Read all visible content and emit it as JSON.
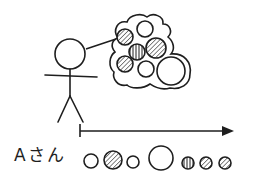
{
  "diagram": {
    "type": "concept-illustration",
    "person": {
      "icon": "stick-figure-icon",
      "thought_bubble": "cloud-icon"
    },
    "thought_circles": [
      {
        "cx": 145,
        "cy": 29,
        "r": 8,
        "fill": "plain"
      },
      {
        "cx": 125,
        "cy": 37,
        "r": 8,
        "fill": "hatch-diagonal"
      },
      {
        "cx": 137,
        "cy": 52,
        "r": 8,
        "fill": "hatch-vertical"
      },
      {
        "cx": 156,
        "cy": 48,
        "r": 10,
        "fill": "hatch-diagonal"
      },
      {
        "cx": 125,
        "cy": 64,
        "r": 8,
        "fill": "hatch-diagonal"
      },
      {
        "cx": 146,
        "cy": 69,
        "r": 8,
        "fill": "plain"
      },
      {
        "cx": 171,
        "cy": 71,
        "r": 14,
        "fill": "plain"
      }
    ],
    "timeline": {
      "arrow": "right-arrow-icon"
    },
    "sequence_label": "Aさん",
    "sequence_circles": [
      {
        "cx": 91,
        "cy": 161,
        "r": 7,
        "fill": "plain"
      },
      {
        "cx": 113,
        "cy": 160,
        "r": 9,
        "fill": "hatch-diagonal"
      },
      {
        "cx": 133,
        "cy": 162,
        "r": 6,
        "fill": "plain"
      },
      {
        "cx": 161,
        "cy": 158,
        "r": 12,
        "fill": "plain"
      },
      {
        "cx": 188,
        "cy": 163,
        "r": 6,
        "fill": "hatch-vertical"
      },
      {
        "cx": 206,
        "cy": 163,
        "r": 6,
        "fill": "hatch-diagonal"
      },
      {
        "cx": 225,
        "cy": 163,
        "r": 6,
        "fill": "hatch-diagonal"
      }
    ],
    "colors": {
      "stroke": "#1e1e1e",
      "background": "#ffffff"
    }
  }
}
